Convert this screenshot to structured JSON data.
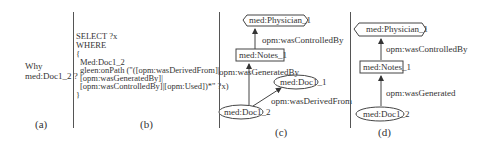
{
  "panel_a": {
    "question_line1": "Why",
    "question_line2": "med:Doc1_2 ?",
    "caption": "(a)"
  },
  "panel_b": {
    "query_lines": [
      "SELECT ?x",
      "WHERE",
      "{",
      "  Med:Doc1_2",
      "  gleen:onPath (\"([opm:wasDerivedFrom]|",
      "  [opm:wasGeneratedBy]|",
      "  [opm:wasControlledBy]|[opm:Used])*\" ?x)",
      "}"
    ],
    "caption": "(b)"
  },
  "panel_c": {
    "nodes": {
      "physician": "med:Physician_1",
      "notes": "med:Notes_1",
      "doc1_1": "med:Doc1_1",
      "doc1_2": "med:Doc1_2"
    },
    "edges": {
      "controlled_by": "opm:wasControlledBy",
      "generated_by": "opm:wasGeneratedBy",
      "derived_from": "opm:wasDerivedFrom"
    },
    "caption": "(c)"
  },
  "panel_d": {
    "nodes": {
      "physician": "med:Physician_1",
      "notes": "med:Notes_1",
      "doc1_2": "med:Doc1_2"
    },
    "edges": {
      "controlled_by": "opm:wasControlledBy",
      "generated": "opm:wasGenerated"
    },
    "caption": "(d)"
  }
}
